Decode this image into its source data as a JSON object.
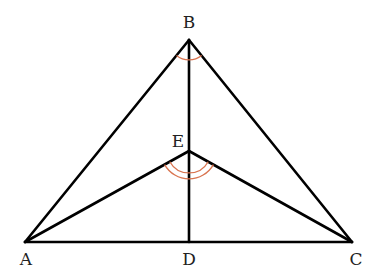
{
  "diagram": {
    "points": {
      "A": {
        "label": "A",
        "x": 25,
        "y": 242
      },
      "B": {
        "label": "B",
        "x": 189,
        "y": 40
      },
      "C": {
        "label": "C",
        "x": 352,
        "y": 242
      },
      "D": {
        "label": "D",
        "x": 189,
        "y": 242
      },
      "E": {
        "label": "E",
        "x": 189,
        "y": 151
      }
    },
    "segments": [
      "AB",
      "BC",
      "AC",
      "BD",
      "AE",
      "EC"
    ],
    "angle_marks": [
      {
        "vertex": "B",
        "angle": "ABC",
        "arcs": 1
      },
      {
        "vertex": "E",
        "angle": "AEC",
        "arcs": 2
      }
    ],
    "colors": {
      "line": "#000000",
      "arc": "#d9734e",
      "label": "#222222"
    }
  }
}
